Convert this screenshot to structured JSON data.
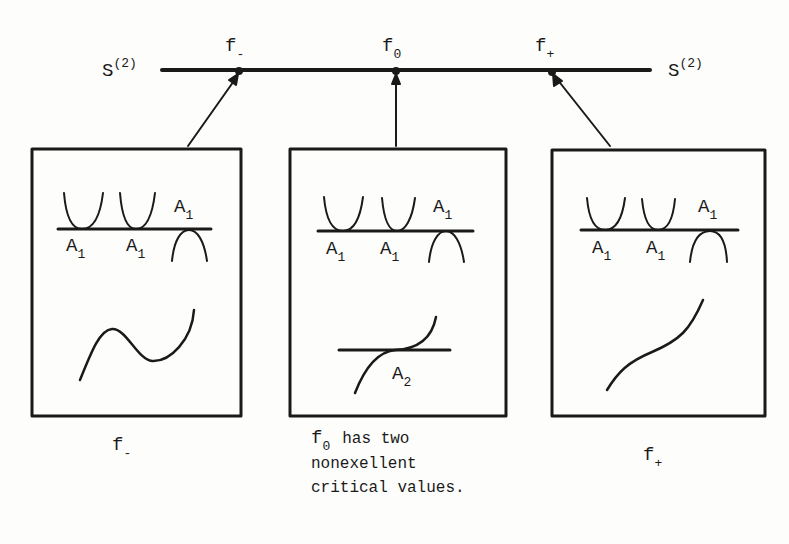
{
  "axis": {
    "left_label": "S",
    "left_label_sup": "(2)",
    "right_label": "S",
    "right_label_sup": "(2)",
    "points": [
      {
        "base": "f",
        "sub": "-"
      },
      {
        "base": "f",
        "sub": "0"
      },
      {
        "base": "f",
        "sub": "+"
      }
    ]
  },
  "panels": [
    {
      "name": "f-minus",
      "critical_labels": [
        {
          "base": "A",
          "sub": "1"
        },
        {
          "base": "A",
          "sub": "1"
        },
        {
          "base": "A",
          "sub": "1"
        }
      ],
      "graph_description": "curve with local max and local min"
    },
    {
      "name": "f-zero",
      "critical_labels": [
        {
          "base": "A",
          "sub": "1"
        },
        {
          "base": "A",
          "sub": "1"
        },
        {
          "base": "A",
          "sub": "1"
        }
      ],
      "inflection_label": {
        "base": "A",
        "sub": "2"
      },
      "graph_description": "cubic inflection tangent to horizontal line"
    },
    {
      "name": "f-plus",
      "critical_labels": [
        {
          "base": "A",
          "sub": "1"
        },
        {
          "base": "A",
          "sub": "1"
        },
        {
          "base": "A",
          "sub": "1"
        }
      ],
      "graph_description": "monotone increasing curve"
    }
  ],
  "captions": {
    "left": {
      "base": "f",
      "sub": "-"
    },
    "middle": {
      "base": "f",
      "sub": "0",
      "line1_rest": "has two",
      "line2": "nonexellent",
      "line3": "critical values."
    },
    "right": {
      "base": "f",
      "sub": "+"
    }
  },
  "colors": {
    "ink": "#1a1a1a",
    "paper": "#fdfdfb"
  }
}
